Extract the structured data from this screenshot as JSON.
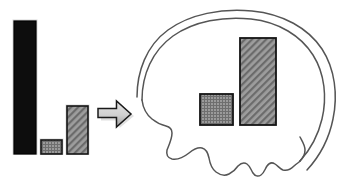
{
  "figure": {
    "background_color": "#ffffff",
    "width": 345,
    "height": 188
  },
  "colors": {
    "outline": "#1a1a1a",
    "brain_outline": "#555555",
    "bar_black_fill": "#0d0d0d",
    "bar_grid_fill": "#8f8f8f",
    "bar_hatch_fill": "#8a8a8a",
    "arrow_fill_light": "#d8d8d8",
    "arrow_fill_dark": "#9a9a9a",
    "arrow_stroke": "#1a1a1a",
    "bar_stroke": "#141414"
  },
  "chart_data": {
    "type": "bar",
    "title": "",
    "xlabel": "",
    "ylabel": "",
    "categories": [
      "bar-1",
      "bar-2",
      "bar-3"
    ],
    "values": [
      133,
      14,
      48
    ],
    "ylim": [
      0,
      133
    ],
    "grid": false,
    "legend": "none",
    "bar_fills": [
      "solid-black",
      "fine-grid-gray",
      "diagonal-crosshatch-gray"
    ],
    "baseline_y": 154
  },
  "brain_chart_data": {
    "type": "bar",
    "title": "",
    "xlabel": "",
    "ylabel": "",
    "categories": [
      "brain-bar-1",
      "brain-bar-2"
    ],
    "values": [
      31,
      87
    ],
    "ylim": [
      0,
      87
    ],
    "grid": false,
    "legend": "none",
    "bar_fills": [
      "fine-grid-gray",
      "diagonal-crosshatch-gray"
    ],
    "baseline_y": 125
  },
  "left_chart": {
    "name": "source-bar-chart",
    "bars": [
      {
        "id": "bar-1",
        "label": "",
        "value": 133,
        "x": 14,
        "y": 21,
        "w": 22,
        "h": 133,
        "fill": "solid"
      },
      {
        "id": "bar-2",
        "label": "",
        "value": 14,
        "x": 41,
        "y": 140,
        "w": 21,
        "h": 14,
        "fill": "grid"
      },
      {
        "id": "bar-3",
        "label": "",
        "value": 48,
        "x": 67,
        "y": 106,
        "w": 21,
        "h": 48,
        "fill": "hatch"
      }
    ]
  },
  "arrow": {
    "name": "transfer-arrow",
    "label": "",
    "direction": "right",
    "x": 98,
    "y": 101,
    "w": 33,
    "h": 26
  },
  "brain": {
    "name": "brain-outline",
    "label": "",
    "orientation": "left-facing lateral view",
    "bars": [
      {
        "id": "brain-bar-1",
        "label": "",
        "value": 31,
        "x": 200,
        "y": 94,
        "w": 33,
        "h": 31,
        "fill": "grid"
      },
      {
        "id": "brain-bar-2",
        "label": "",
        "value": 87,
        "x": 240,
        "y": 38,
        "w": 36,
        "h": 87,
        "fill": "hatch"
      }
    ]
  }
}
